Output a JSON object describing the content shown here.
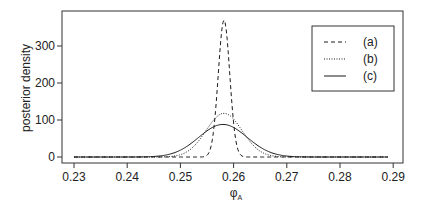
{
  "chart_data": {
    "type": "line",
    "title": "",
    "xlabel": "φ_A",
    "xlabel_main": "φ",
    "xlabel_sub": "A",
    "ylabel": "posterior density",
    "xlim": [
      0.2278,
      0.2918
    ],
    "ylim": [
      -15,
      405
    ],
    "xticks": [
      0.23,
      0.24,
      0.25,
      0.26,
      0.27,
      0.28,
      0.29
    ],
    "xtick_labels": [
      "0.23",
      "0.24",
      "0.25",
      "0.26",
      "0.27",
      "0.28",
      "0.29"
    ],
    "yticks": [
      0,
      100,
      200,
      300
    ],
    "ytick_labels": [
      "0",
      "100",
      "200",
      "300"
    ],
    "grid": false,
    "legend_position": "upper right",
    "x_range": [
      0.23,
      0.289
    ],
    "series": [
      {
        "name": "(a)",
        "linestyle": "dashed",
        "distribution": "normal",
        "mean": 0.2582,
        "sd": 0.00108,
        "peak": 370,
        "x": [
          0.23,
          0.254,
          0.255,
          0.256,
          0.257,
          0.258,
          0.259,
          0.26,
          0.261,
          0.262,
          0.289
        ],
        "values": [
          0,
          1,
          5,
          50,
          200,
          368,
          310,
          115,
          15,
          1,
          0
        ]
      },
      {
        "name": "(b)",
        "linestyle": "dotted",
        "distribution": "normal",
        "mean": 0.2582,
        "sd": 0.00338,
        "peak": 118,
        "x": [
          0.23,
          0.245,
          0.25,
          0.254,
          0.256,
          0.258,
          0.26,
          0.262,
          0.266,
          0.27,
          0.289
        ],
        "values": [
          0,
          0,
          6,
          53,
          95,
          118,
          103,
          63,
          8,
          0,
          0
        ]
      },
      {
        "name": "(c)",
        "linestyle": "solid",
        "distribution": "normal",
        "mean": 0.258,
        "sd": 0.00453,
        "peak": 88,
        "x": [
          0.23,
          0.245,
          0.25,
          0.254,
          0.256,
          0.258,
          0.26,
          0.262,
          0.266,
          0.27,
          0.275,
          0.289
        ],
        "values": [
          0,
          1,
          18,
          59,
          80,
          88,
          80,
          59,
          18,
          3,
          0,
          0
        ]
      }
    ]
  },
  "legend": {
    "items": [
      {
        "label": "(a)",
        "style": "dashed"
      },
      {
        "label": "(b)",
        "style": "dotted"
      },
      {
        "label": "(c)",
        "style": "solid"
      }
    ]
  },
  "colors": {
    "line": "#1a1a1a",
    "axis": "#333333",
    "background": "#ffffff"
  }
}
